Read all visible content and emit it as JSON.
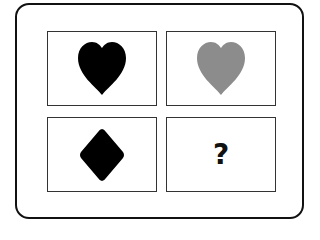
{
  "puzzle": {
    "panels": [
      {
        "shape": "heart-icon",
        "color": "#000000"
      },
      {
        "shape": "heart-icon",
        "color": "#8c8c8c"
      },
      {
        "shape": "diamond-icon",
        "color": "#000000"
      },
      {
        "shape": "unknown",
        "label": "?"
      }
    ],
    "colors": {
      "frame": "#111111",
      "panel_border": "#333333",
      "black": "#000000",
      "gray": "#8c8c8c"
    }
  }
}
